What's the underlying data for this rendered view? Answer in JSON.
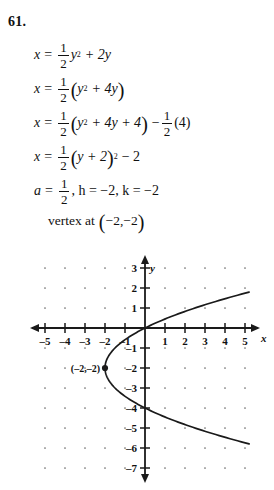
{
  "problem": {
    "number": "61."
  },
  "solution": {
    "steps": [
      {
        "id": "step1",
        "lhs": "x",
        "eq": "=",
        "frac_num": "1",
        "frac_den": "2",
        "rhs": "y",
        "exp": "2",
        "tail": "+ 2y"
      },
      {
        "id": "step2",
        "lhs": "x",
        "eq": "=",
        "frac_num": "1",
        "frac_den": "2",
        "inner": "y",
        "exp": "2",
        "inner_tail": "+ 4y"
      },
      {
        "id": "step3",
        "lhs": "x",
        "eq": "=",
        "frac_num": "1",
        "frac_den": "2",
        "inner": "y",
        "exp": "2",
        "inner_tail": "+ 4y + 4",
        "minus": "−",
        "frac2_num": "1",
        "frac2_den": "2",
        "tail2": "(4)"
      },
      {
        "id": "step4",
        "lhs": "x",
        "eq": "=",
        "frac_num": "1",
        "frac_den": "2",
        "inner": "y + 2",
        "exp": "2",
        "tail": "− 2"
      },
      {
        "id": "step5",
        "a_label": "a",
        "eq": "=",
        "frac_num": "1",
        "frac_den": "2",
        "hk": ", h = −2, k = −2"
      }
    ],
    "vertex_text": "vertex at",
    "vertex_value": "(−2,−2)"
  },
  "graph": {
    "x_axis_name": "x",
    "y_axis_name": "y",
    "x_tick_labels": [
      "–5",
      "–4",
      "–3",
      "–2",
      "–1",
      "1",
      "2",
      "3",
      "4",
      "5"
    ],
    "x_tick_values": [
      -5,
      -4,
      -3,
      -2,
      -1,
      1,
      2,
      3,
      4,
      5
    ],
    "y_tick_labels": [
      "3",
      "2",
      "1",
      "–1",
      "–2",
      "–3",
      "–4",
      "–5",
      "–6",
      "–7"
    ],
    "y_tick_values": [
      3,
      2,
      1,
      -1,
      -2,
      -3,
      -4,
      -5,
      -6,
      -7
    ],
    "vertex_point_label": "(–2,–2)",
    "vertex_point": {
      "x": -2,
      "y": -2
    },
    "axis_color": "#1a1a1a",
    "curve_color": "#1a1a1a",
    "dot_color": "#6b6b6b",
    "x_range": [
      -5.6,
      5.9
    ],
    "y_range": [
      -7.6,
      3.6
    ]
  },
  "chart_data": {
    "type": "line",
    "title": "",
    "xlabel": "x",
    "ylabel": "y",
    "equation": "x = (1/2)(y + 2)^2 - 2",
    "xlim": [
      -5.6,
      5.9
    ],
    "ylim": [
      -7.6,
      3.6
    ],
    "grid": "dot-lattice at integer points",
    "legend": "none",
    "annotations": [
      {
        "text": "(–2,–2)",
        "x": -2,
        "y": -2,
        "type": "vertex-point"
      }
    ],
    "series": [
      {
        "name": "x = 1/2 (y+2)^2 - 2",
        "orientation": "sideways-parabola-opens-right",
        "points_xy": [
          [
            5.12,
            -7.2
          ],
          [
            3.12,
            -5.35
          ],
          [
            2.0,
            -4.83
          ],
          [
            1.12,
            -4.36
          ],
          [
            0.5,
            -4.0
          ],
          [
            0.0,
            -3.64
          ],
          [
            -0.5,
            -3.17
          ],
          [
            -1.0,
            -2.59
          ],
          [
            -1.5,
            -1.88
          ],
          [
            -1.875,
            -1.5
          ],
          [
            -2.0,
            -2.0
          ],
          [
            -1.875,
            -2.5
          ],
          [
            -1.5,
            -3.0
          ],
          [
            -1.0,
            -1.41
          ],
          [
            -0.5,
            -0.83
          ],
          [
            0.0,
            0.0
          ],
          [
            0.5,
            0.45
          ],
          [
            1.12,
            0.36
          ],
          [
            2.0,
            0.83
          ],
          [
            3.12,
            1.35
          ],
          [
            5.12,
            3.2
          ]
        ],
        "key_points": [
          {
            "label": "vertex",
            "x": -2,
            "y": -2
          },
          {
            "label": "y-intercept-upper",
            "x": 0,
            "y": 0
          },
          {
            "label": "y-intercept-lower",
            "x": 0,
            "y": -4
          }
        ]
      }
    ]
  }
}
